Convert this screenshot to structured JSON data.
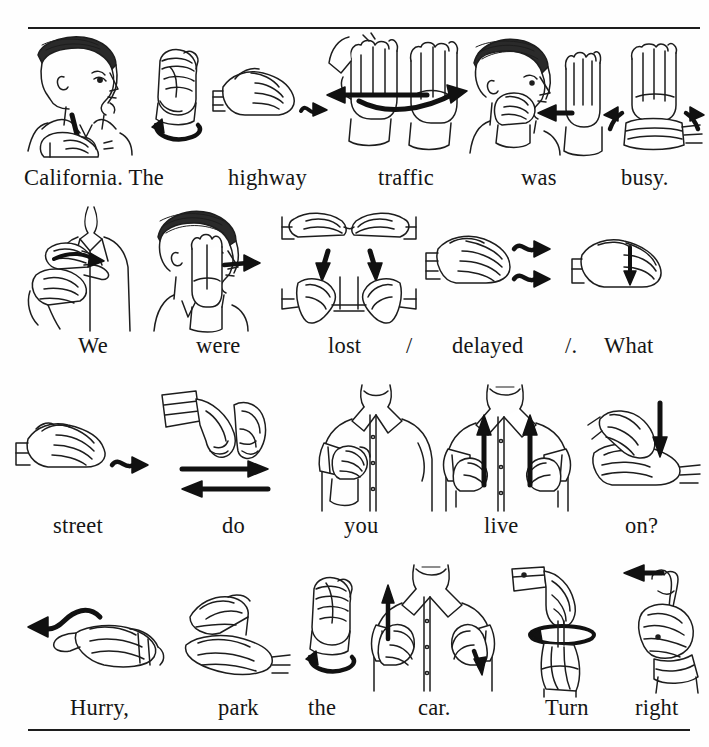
{
  "page": {
    "kind": "sign-language-lesson-page",
    "background_color": "#fefefe",
    "ink_color": "#1d1d1d",
    "rule_top": true,
    "rule_bottom": true
  },
  "rows": [
    {
      "id": "row-1",
      "sentence": "California. The highway traffic was busy.",
      "words": [
        {
          "label": "California. The",
          "x": 24,
          "sign": "home-state-point-sign"
        },
        {
          "label": "highway",
          "x": 228,
          "sign": "highway-two-hands-sign"
        },
        {
          "label": "traffic",
          "x": 378,
          "sign": "traffic-open-palms-sign"
        },
        {
          "label": "was",
          "x": 521,
          "sign": "was-past-hand-sign"
        },
        {
          "label": "busy.",
          "x": 621,
          "sign": "busy-b-hand-sign"
        }
      ],
      "illustrations": [
        {
          "name": "head-profile-pointing-down",
          "x": 20,
          "w": 120,
          "h": 120,
          "motion": "down-arrow"
        },
        {
          "name": "fist-thumb-rotating",
          "x": 140,
          "w": 70,
          "h": 120,
          "motion": "circular-arrow"
        },
        {
          "name": "two-flat-hands-forward",
          "x": 205,
          "w": 110,
          "h": 110,
          "motion": "wavy-arrow-right"
        },
        {
          "name": "two-open-palms-passing",
          "x": 315,
          "w": 155,
          "h": 120,
          "motion": "double-horizontal-arrows"
        },
        {
          "name": "profile-head-hand-at-cheek",
          "x": 470,
          "w": 135,
          "h": 120,
          "motion": "arrow-left"
        },
        {
          "name": "b-hand-upright-on-wrist",
          "x": 605,
          "w": 95,
          "h": 120,
          "motion": "arrows-out"
        }
      ]
    },
    {
      "id": "row-2",
      "sentence": "We were lost / delayed /. What",
      "words": [
        {
          "label": "We",
          "x": 78,
          "sign": "we-sweep-shoulder-sign"
        },
        {
          "label": "were",
          "x": 196,
          "sign": "were-hand-from-mouth-sign"
        },
        {
          "label": "lost",
          "x": 328,
          "sign": "lost-hands-open-down-sign"
        },
        {
          "label": "/",
          "x": 406,
          "sign": "slash-separator"
        },
        {
          "label": "delayed",
          "x": 452,
          "sign": "delayed-hands-forward-sign"
        },
        {
          "label": "/.",
          "x": 565,
          "sign": "slash-period-separator"
        },
        {
          "label": "What",
          "x": 604,
          "sign": "what-hand-sign"
        }
      ],
      "illustrations": [
        {
          "name": "hand-pointing-across-chest",
          "x": 20,
          "w": 130,
          "h": 125,
          "motion": "curve-arrow-right"
        },
        {
          "name": "profile-head-hand-at-mouth",
          "x": 150,
          "w": 125,
          "h": 125,
          "motion": "arrow-right"
        },
        {
          "name": "two-fists-together-opening",
          "x": 275,
          "w": 150,
          "h": 125,
          "motion": "two-down-arrows"
        },
        {
          "name": "flat-hands-stacked-forward",
          "x": 425,
          "w": 145,
          "h": 110,
          "motion": "double-wavy-arrows-right"
        },
        {
          "name": "fist-over-flat-hand",
          "x": 570,
          "w": 115,
          "h": 110,
          "motion": "short-arrow"
        }
      ]
    },
    {
      "id": "row-3",
      "sentence": "street do you live on?",
      "words": [
        {
          "label": "street",
          "x": 53,
          "sign": "street-two-flat-hands-sign"
        },
        {
          "label": "do",
          "x": 222,
          "sign": "do-hands-side-to-side-sign"
        },
        {
          "label": "you",
          "x": 344,
          "sign": "you-point-sign"
        },
        {
          "label": "live",
          "x": 484,
          "sign": "live-a-hands-up-sign"
        },
        {
          "label": "on?",
          "x": 625,
          "sign": "on-hand-on-hand-sign"
        }
      ],
      "illustrations": [
        {
          "name": "two-flat-hands-parallel",
          "x": 10,
          "w": 140,
          "h": 110,
          "motion": "wavy-arrow-right"
        },
        {
          "name": "claw-hands-moving-sideways",
          "x": 155,
          "w": 155,
          "h": 120,
          "motion": "two-opposing-arrows"
        },
        {
          "name": "torso-shirt-pointing-front",
          "x": 310,
          "w": 130,
          "h": 125,
          "motion": "none"
        },
        {
          "name": "torso-shirt-a-hands-upward",
          "x": 430,
          "w": 165,
          "h": 125,
          "motion": "two-up-arrows"
        },
        {
          "name": "flat-hand-onto-flat-hand",
          "x": 590,
          "w": 115,
          "h": 115,
          "motion": "down-arrow"
        }
      ]
    },
    {
      "id": "row-4",
      "sentence": "Hurry, park the car. Turn right",
      "words": [
        {
          "label": "Hurry,",
          "x": 70,
          "sign": "hurry-shaking-hands-sign"
        },
        {
          "label": "park",
          "x": 218,
          "sign": "park-v-hand-on-palm-sign"
        },
        {
          "label": "the",
          "x": 308,
          "sign": "the-t-hand-sign"
        },
        {
          "label": "car.",
          "x": 418,
          "sign": "car-steering-wheel-sign"
        },
        {
          "label": "Turn",
          "x": 545,
          "sign": "turn-hand-rotating-sign"
        },
        {
          "label": "right",
          "x": 635,
          "sign": "right-r-hand-sign"
        }
      ],
      "illustrations": [
        {
          "name": "pointing-hand-shaking-left",
          "x": 25,
          "w": 145,
          "h": 110,
          "motion": "double-curve-arrow-left"
        },
        {
          "name": "v-hand-landing-on-palm",
          "x": 175,
          "w": 125,
          "h": 115,
          "motion": "none"
        },
        {
          "name": "t-hand-rotating",
          "x": 295,
          "w": 70,
          "h": 115,
          "motion": "circular-arrow"
        },
        {
          "name": "torso-shirt-steering-wheel",
          "x": 360,
          "w": 150,
          "h": 125,
          "motion": "up-down-arrow"
        },
        {
          "name": "hand-twisting-over-finger",
          "x": 505,
          "w": 115,
          "h": 130,
          "motion": "circular-arrow"
        },
        {
          "name": "r-hand-upright",
          "x": 620,
          "w": 85,
          "h": 125,
          "motion": "arrow-left"
        }
      ]
    }
  ],
  "layout": {
    "row_art_tops": [
      33,
      205,
      385,
      565
    ],
    "row_caption_tops": [
      165,
      333,
      515,
      695
    ]
  }
}
